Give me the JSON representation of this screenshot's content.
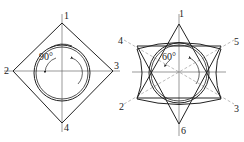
{
  "figures": [
    {
      "name": "square-cross-section",
      "angle_label": "90°",
      "labels": [
        "1",
        "2",
        "3",
        "4"
      ]
    },
    {
      "name": "hexagonal-cross-section",
      "angle_label": "60°",
      "labels": [
        "1",
        "2",
        "3",
        "4",
        "5",
        "6"
      ]
    }
  ]
}
